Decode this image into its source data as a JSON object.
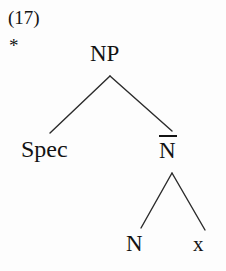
{
  "figure": {
    "example_number": "(17)",
    "grammaticality_marker": "*",
    "caption": "",
    "background_color": "#fdfdfd",
    "ink_color": "#131313",
    "branch_color": "#2b2b2b"
  },
  "tree": {
    "type": "x-bar-syntax-tree",
    "nodes": [
      {
        "id": "np",
        "label": "NP",
        "x": 110,
        "y": 56,
        "overbar": false
      },
      {
        "id": "spec",
        "label": "Spec",
        "x": 50,
        "y": 150,
        "overbar": false
      },
      {
        "id": "nbar",
        "label": "N",
        "x": 172,
        "y": 150,
        "overbar": true
      },
      {
        "id": "n",
        "label": "N",
        "x": 135,
        "y": 244,
        "overbar": false
      },
      {
        "id": "x",
        "label": "x",
        "x": 200,
        "y": 244,
        "overbar": false
      }
    ],
    "edges": [
      {
        "from": "np",
        "to": "spec",
        "x1": 110,
        "y1": 76,
        "x2": 50,
        "y2": 133
      },
      {
        "from": "np",
        "to": "nbar",
        "x1": 110,
        "y1": 76,
        "x2": 172,
        "y2": 131
      },
      {
        "from": "nbar",
        "to": "n",
        "x1": 172,
        "y1": 173,
        "x2": 141,
        "y2": 228
      },
      {
        "from": "nbar",
        "to": "x",
        "x1": 172,
        "y1": 173,
        "x2": 205,
        "y2": 230
      }
    ]
  }
}
